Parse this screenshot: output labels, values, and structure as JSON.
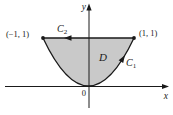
{
  "figure": {
    "colors": {
      "region_fill": "#c9c9c9",
      "line": "#1a1a1a"
    },
    "labels": {
      "y_axis": "y",
      "x_axis": "x",
      "origin": "0",
      "point_top_left": "(−1, 1)",
      "point_top_right": "(1, 1)",
      "region": "D",
      "curve_c1": {
        "base": "C",
        "sub": "1"
      },
      "curve_c2": {
        "base": "C",
        "sub": "2"
      }
    }
  }
}
